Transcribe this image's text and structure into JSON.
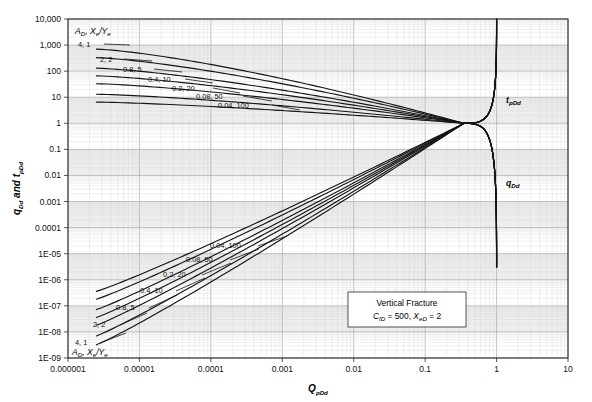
{
  "chart_data": {
    "type": "line",
    "title": "",
    "xlabel": "QpDd",
    "ylabel": "qDd and tpDd",
    "xscale": "log",
    "yscale": "log",
    "xlim": [
      1e-06,
      10
    ],
    "ylim": [
      1e-09,
      10000
    ],
    "grid": true,
    "legend_position": "inline-labels",
    "xticks": [
      "0.000001",
      "0.00001",
      "0.0001",
      "0.001",
      "0.01",
      "0.1",
      "1",
      "10"
    ],
    "yticks": [
      "10,000",
      "1,000",
      "100",
      "10",
      "1",
      "0.1",
      "0.01",
      "0.001",
      "0.0001",
      "1E-05",
      "1E-06",
      "1E-07",
      "1E-08",
      "1E-09"
    ],
    "legend_header": "AD, Xe/Ye",
    "annotation": {
      "line1": "Vertical Fracture",
      "line2": "CfD = 500, XeD = 2"
    },
    "branch_labels": {
      "upper": "tpDd",
      "lower": "qDd"
    },
    "series": [
      {
        "name": "4, 1",
        "AD": 4,
        "XeYe": 1,
        "upper_start_y": 700,
        "lower_start_y": 3.2e-09
      },
      {
        "name": "2, 2",
        "AD": 2,
        "XeYe": 2,
        "upper_start_y": 330,
        "lower_start_y": 7e-09
      },
      {
        "name": "0.8, 5",
        "AD": 0.8,
        "XeYe": 5,
        "upper_start_y": 130,
        "lower_start_y": 1.8e-08
      },
      {
        "name": "0.4, 10",
        "AD": 0.4,
        "XeYe": 10,
        "upper_start_y": 66,
        "lower_start_y": 3.6e-08
      },
      {
        "name": "0.2, 20",
        "AD": 0.2,
        "XeYe": 20,
        "upper_start_y": 33,
        "lower_start_y": 7.2e-08
      },
      {
        "name": "0.08, 50",
        "AD": 0.08,
        "XeYe": 50,
        "upper_start_y": 13,
        "lower_start_y": 1.8e-07
      },
      {
        "name": "0.04, 100",
        "AD": 0.04,
        "XeYe": 100,
        "upper_start_y": 6.5,
        "lower_start_y": 3.6e-07
      }
    ],
    "convergence_point": {
      "x": 0.35,
      "y": 1.0
    },
    "terminal_x": 1.0,
    "upper_terminal_y": 10000,
    "lower_terminal_y": 3e-06
  },
  "labels": {
    "legend_header_main": "A",
    "legend_header_sub1": "D",
    "legend_header_mid": ", X",
    "legend_header_sub2": "e",
    "legend_header_slash": "/Y",
    "legend_header_sub3": "e",
    "ytitle_q": "q",
    "ytitle_qsub": "Dd",
    "ytitle_and": " and ",
    "ytitle_t": "t",
    "ytitle_tsub": "pDd",
    "xtitle_Q": "Q",
    "xtitle_sub": "pDd",
    "tpdd_main": "t",
    "tpdd_sub": "pDd",
    "qdd_main": "q",
    "qdd_sub": "Dd",
    "annot_l1": "Vertical Fracture",
    "annot_c": "C",
    "annot_cfd": "fD",
    "annot_eq": " = 500, ",
    "annot_x": "X",
    "annot_xed": "eD",
    "annot_eq2": " = 2"
  },
  "colors": {
    "curve": "#141414",
    "grid_minor": "#d6d6d6",
    "grid_major": "#9a9a9a",
    "band": "#ededed",
    "frame": "#2b2b2b",
    "background": "#ffffff"
  }
}
